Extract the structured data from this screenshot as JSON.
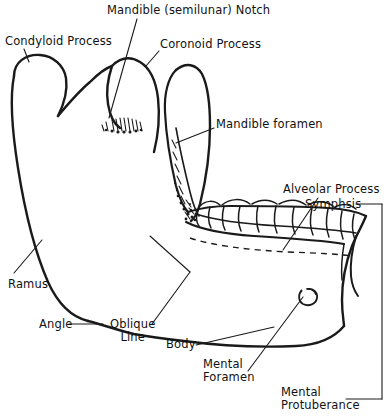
{
  "figure": {
    "background_color": "#ffffff",
    "ink_color": "#111111",
    "labels": [
      {
        "id": "mandible-notch",
        "text": "Mandible (semilunar) Notch",
        "x": 107,
        "y": 4,
        "align": "left"
      },
      {
        "id": "condyloid-process",
        "text": "Condyloid Process",
        "x": 5,
        "y": 35,
        "align": "left"
      },
      {
        "id": "coronoid-process",
        "text": "Coronoid Process",
        "x": 160,
        "y": 38,
        "align": "left"
      },
      {
        "id": "mandible-foramen",
        "text": "Mandible foramen",
        "x": 216,
        "y": 118,
        "align": "left"
      },
      {
        "id": "alveolar-process",
        "text": "Alveolar Process",
        "x": 283,
        "y": 183,
        "align": "left"
      },
      {
        "id": "symphsis",
        "text": "Symphsis",
        "x": 305,
        "y": 198,
        "align": "left"
      },
      {
        "id": "ramus",
        "text": "Ramus",
        "x": 8,
        "y": 278,
        "align": "left"
      },
      {
        "id": "angle",
        "text": "Angle",
        "x": 39,
        "y": 320,
        "align": "left"
      },
      {
        "id": "oblique-line",
        "text": "Oblique\nLine",
        "x": 110,
        "y": 322,
        "align": "left"
      },
      {
        "id": "body",
        "text": "Body",
        "x": 166,
        "y": 340,
        "align": "left"
      },
      {
        "id": "mental-foramen",
        "text": "Mental\nForamen",
        "x": 203,
        "y": 358,
        "align": "left"
      },
      {
        "id": "mental-protuberance",
        "text": "Mental\nProtuberance",
        "x": 281,
        "y": 388,
        "align": "left"
      }
    ],
    "parts": [
      "condyloid process",
      "coronoid process",
      "mandibular (semilunar) notch",
      "mandibular foramen",
      "ramus",
      "angle",
      "oblique line",
      "body",
      "mental foramen",
      "mental protuberance",
      "alveolar process",
      "symphysis",
      "teeth"
    ]
  }
}
